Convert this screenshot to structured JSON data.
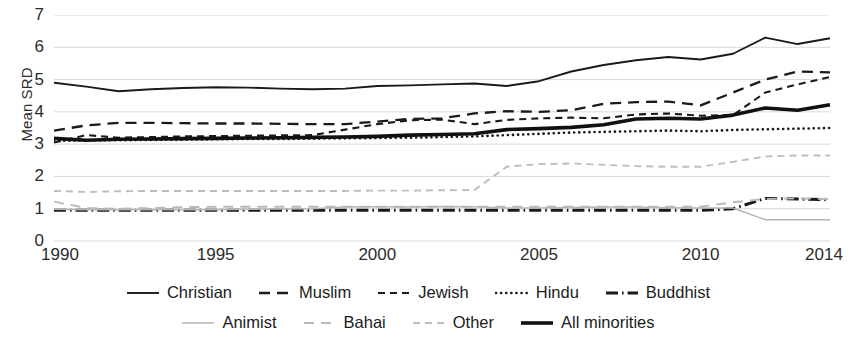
{
  "axes": {
    "ylabel": "Mean SRD",
    "yticks": [
      "7",
      "6",
      "5",
      "4",
      "3",
      "2",
      "1",
      "0"
    ],
    "xticks": [
      "1990",
      "1995",
      "2000",
      "2005",
      "2010",
      "2014"
    ]
  },
  "legend": {
    "row1": [
      {
        "label": "Christian",
        "style": "solid",
        "icon": "solid-line-swatch"
      },
      {
        "label": "Muslim",
        "style": "dash-long",
        "icon": "long-dash-line-swatch"
      },
      {
        "label": "Jewish",
        "style": "dash",
        "icon": "dash-line-swatch"
      },
      {
        "label": "Hindu",
        "style": "dot",
        "icon": "dotted-line-swatch"
      },
      {
        "label": "Buddhist",
        "style": "dashdot",
        "icon": "dash-dot-line-swatch"
      }
    ],
    "row2": [
      {
        "label": "Animist",
        "style": "solid-light",
        "icon": "light-solid-line-swatch"
      },
      {
        "label": "Bahai",
        "style": "dash-light",
        "icon": "light-long-dash-line-swatch"
      },
      {
        "label": "Other",
        "style": "dash2-light",
        "icon": "light-dash-line-swatch"
      },
      {
        "label": "All minorities",
        "style": "thick",
        "icon": "thick-solid-line-swatch"
      }
    ]
  },
  "chart_data": {
    "type": "line",
    "title": "",
    "xlabel": "",
    "ylabel": "Mean SRD",
    "xlim": [
      1990,
      2014
    ],
    "ylim": [
      0,
      7
    ],
    "grid": true,
    "legend_position": "bottom",
    "x": [
      1990,
      1991,
      1992,
      1993,
      1994,
      1995,
      1996,
      1997,
      1998,
      1999,
      2000,
      2001,
      2002,
      2003,
      2004,
      2005,
      2006,
      2007,
      2008,
      2009,
      2010,
      2011,
      2012,
      2013,
      2014
    ],
    "series": [
      {
        "name": "Christian",
        "style": "solid",
        "color": "#1a1a1a",
        "values": [
          4.9,
          4.78,
          4.64,
          4.7,
          4.74,
          4.76,
          4.75,
          4.72,
          4.7,
          4.72,
          4.8,
          4.82,
          4.85,
          4.88,
          4.8,
          4.95,
          5.25,
          5.45,
          5.6,
          5.7,
          5.62,
          5.8,
          6.3,
          6.1,
          6.28
        ]
      },
      {
        "name": "Muslim",
        "style": "dash-long",
        "color": "#1a1a1a",
        "values": [
          3.42,
          3.58,
          3.66,
          3.66,
          3.65,
          3.64,
          3.64,
          3.63,
          3.62,
          3.62,
          3.7,
          3.78,
          3.8,
          3.95,
          4.02,
          4.0,
          4.05,
          4.25,
          4.3,
          4.32,
          4.2,
          4.6,
          5.0,
          5.25,
          5.22
        ]
      },
      {
        "name": "Jewish",
        "style": "dash",
        "color": "#1a1a1a",
        "values": [
          3.05,
          3.28,
          3.2,
          3.22,
          3.24,
          3.25,
          3.26,
          3.27,
          3.28,
          3.45,
          3.62,
          3.74,
          3.76,
          3.62,
          3.75,
          3.8,
          3.82,
          3.8,
          3.92,
          3.95,
          3.88,
          3.9,
          4.6,
          4.85,
          5.08
        ]
      },
      {
        "name": "Hindu",
        "style": "dot",
        "color": "#1a1a1a",
        "values": [
          3.1,
          3.12,
          3.12,
          3.13,
          3.14,
          3.15,
          3.16,
          3.16,
          3.17,
          3.18,
          3.19,
          3.2,
          3.22,
          3.24,
          3.28,
          3.32,
          3.36,
          3.38,
          3.4,
          3.42,
          3.4,
          3.44,
          3.46,
          3.48,
          3.5
        ]
      },
      {
        "name": "Buddhist",
        "style": "dashdot",
        "color": "#1a1a1a",
        "values": [
          0.95,
          0.95,
          0.95,
          0.95,
          0.95,
          0.95,
          0.95,
          0.95,
          0.95,
          0.95,
          0.95,
          0.95,
          0.95,
          0.95,
          0.95,
          0.95,
          0.95,
          0.95,
          0.95,
          0.95,
          0.95,
          1.0,
          1.32,
          1.3,
          1.28
        ]
      },
      {
        "name": "Animist",
        "style": "solid-light",
        "color": "#b5b5b5",
        "values": [
          0.98,
          0.97,
          0.97,
          0.97,
          0.97,
          0.97,
          0.98,
          0.99,
          1.0,
          1.05,
          1.06,
          1.05,
          1.07,
          1.06,
          1.02,
          1.02,
          1.04,
          1.05,
          1.05,
          1.03,
          1.02,
          1.02,
          0.66,
          0.66,
          0.66
        ]
      },
      {
        "name": "Bahai",
        "style": "dash-light",
        "color": "#b8b8b8",
        "values": [
          1.22,
          1.02,
          1.0,
          1.02,
          1.05,
          1.06,
          1.06,
          1.06,
          1.06,
          1.06,
          1.06,
          1.06,
          1.06,
          1.06,
          1.06,
          1.06,
          1.06,
          1.06,
          1.06,
          1.06,
          1.06,
          1.2,
          1.3,
          1.32,
          1.3
        ]
      },
      {
        "name": "Other",
        "style": "dash2-light",
        "color": "#bdbdbd",
        "values": [
          1.55,
          1.52,
          1.54,
          1.55,
          1.55,
          1.55,
          1.55,
          1.55,
          1.55,
          1.55,
          1.56,
          1.56,
          1.57,
          1.58,
          2.3,
          2.38,
          2.4,
          2.36,
          2.32,
          2.3,
          2.3,
          2.45,
          2.62,
          2.65,
          2.65
        ]
      },
      {
        "name": "All minorities",
        "style": "thick",
        "color": "#111111",
        "values": [
          3.18,
          3.12,
          3.15,
          3.16,
          3.17,
          3.18,
          3.19,
          3.2,
          3.21,
          3.22,
          3.24,
          3.28,
          3.3,
          3.32,
          3.45,
          3.48,
          3.52,
          3.6,
          3.78,
          3.8,
          3.78,
          3.9,
          4.12,
          4.05,
          4.22
        ]
      }
    ]
  }
}
